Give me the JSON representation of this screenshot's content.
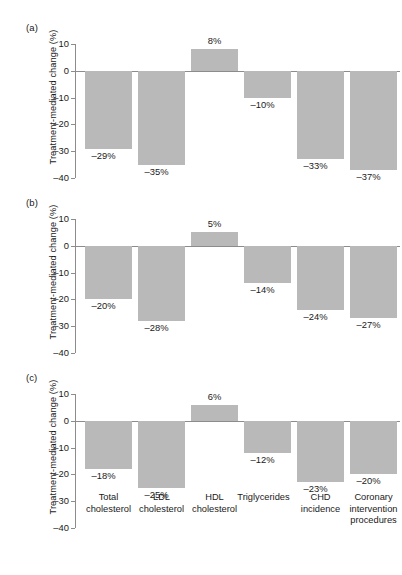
{
  "figure": {
    "ylabel": "Treatment-mediated change (%)",
    "bar_color": "#b9b9b9",
    "axis_color": "#8c8c8c"
  },
  "axis": {
    "ticks": [
      10,
      0,
      -10,
      -20,
      -30,
      -40
    ],
    "tick_labels": [
      "10",
      "0",
      "–10",
      "–20",
      "–30",
      "–40"
    ],
    "ylim": [
      -40,
      10
    ]
  },
  "categories": [
    "Total\ncholesterol",
    "LDL\ncholesterol",
    "HDL\ncholesterol",
    "Triglycerides",
    "CHD\nincidence",
    "Coronary\nintervention\nprocedures"
  ],
  "panels": [
    {
      "label": "(a)",
      "values": [
        -29,
        -35,
        8,
        -10,
        -33,
        -37
      ],
      "value_labels": [
        "–29%",
        "–35%",
        "8%",
        "–10%",
        "–33%",
        "–37%"
      ]
    },
    {
      "label": "(b)",
      "values": [
        -20,
        -28,
        5,
        -14,
        -24,
        -27
      ],
      "value_labels": [
        "–20%",
        "–28%",
        "5%",
        "–14%",
        "–24%",
        "–27%"
      ]
    },
    {
      "label": "(c)",
      "values": [
        -18,
        -25,
        6,
        -12,
        -23,
        -20
      ],
      "value_labels": [
        "–18%",
        "–25%",
        "6%",
        "–12%",
        "–23%",
        "–20%"
      ]
    }
  ],
  "chart_data": {
    "type": "bar",
    "title": "",
    "xlabel": "",
    "ylabel": "Treatment-mediated change (%)",
    "ylim": [
      -40,
      10
    ],
    "grid": false,
    "legend": "none",
    "categories": [
      "Total cholesterol",
      "LDL cholesterol",
      "HDL cholesterol",
      "Triglycerides",
      "CHD incidence",
      "Coronary intervention procedures"
    ],
    "subplots": [
      {
        "panel": "(a)",
        "values": [
          -29,
          -35,
          8,
          -10,
          -33,
          -37
        ],
        "data_labels": [
          "–29%",
          "–35%",
          "8%",
          "–10%",
          "–33%",
          "–37%"
        ]
      },
      {
        "panel": "(b)",
        "values": [
          -20,
          -28,
          5,
          -14,
          -24,
          -27
        ],
        "data_labels": [
          "–20%",
          "–28%",
          "5%",
          "–14%",
          "–24%",
          "–27%"
        ]
      },
      {
        "panel": "(c)",
        "values": [
          -18,
          -25,
          6,
          -12,
          -23,
          -20
        ],
        "data_labels": [
          "–18%",
          "–25%",
          "6%",
          "–12%",
          "–23%",
          "–20%"
        ]
      }
    ]
  }
}
